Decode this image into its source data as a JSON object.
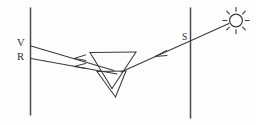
{
  "figure": {
    "background_color": "#fdfdfc",
    "ink_color": "#3a3a3a",
    "width": 256,
    "height": 125
  },
  "labels": {
    "violet": "V",
    "red": "R",
    "source_ray": "S"
  },
  "icons": {
    "sun": "sun-icon",
    "prism": "prism-icon",
    "screen": "screen-line-icon",
    "arrow": "arrowhead-icon"
  },
  "diagram_data": {
    "type": "optics-ray-diagram",
    "elements": [
      {
        "name": "left-screen",
        "kind": "vertical-line",
        "x": 30,
        "y1": 8,
        "y2": 115
      },
      {
        "name": "right-screen",
        "kind": "vertical-line",
        "x": 190,
        "y1": 8,
        "y2": 118
      },
      {
        "name": "incident-ray",
        "kind": "ray",
        "from": [
          232,
          22
        ],
        "to": [
          120,
          72
        ],
        "label": "S",
        "arrow_at": [
          168,
          50
        ]
      },
      {
        "name": "violet-ray",
        "kind": "ray",
        "from": [
          113,
          70
        ],
        "to": [
          32,
          46
        ],
        "label": "V",
        "arrow_at": [
          70,
          57
        ]
      },
      {
        "name": "red-ray",
        "kind": "ray",
        "from": [
          116,
          74
        ],
        "to": [
          32,
          58
        ],
        "label": "R",
        "arrow_at": [
          70,
          66
        ]
      },
      {
        "name": "prism-large",
        "kind": "inverted-triangle",
        "top_left": [
          90,
          52
        ],
        "top_right": [
          136,
          52
        ],
        "apex": [
          112,
          88
        ]
      },
      {
        "name": "prism-small",
        "kind": "inverted-triangle",
        "top_left": [
          97,
          71
        ],
        "top_right": [
          126,
          71
        ],
        "apex": [
          115,
          97
        ]
      },
      {
        "name": "sun",
        "kind": "sun-symbol",
        "center": [
          236,
          20
        ],
        "radius": 7,
        "ray_count": 8
      }
    ]
  }
}
